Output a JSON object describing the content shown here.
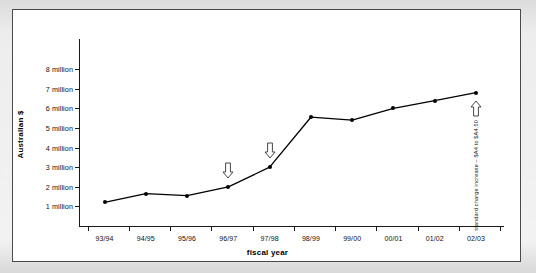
{
  "chart_data": {
    "type": "line",
    "title": "",
    "xlabel": "fiscal year",
    "ylabel": "Australian $",
    "categories": [
      "93/94",
      "94/95",
      "95/96",
      "96/97",
      "97/98",
      "98/99",
      "99/00",
      "00/01",
      "01/02",
      "02/03"
    ],
    "values": [
      1.2,
      1.65,
      1.55,
      2.0,
      3.0,
      5.55,
      5.4,
      6.0,
      6.4,
      6.8
    ],
    "series": [
      {
        "name": "Australian $",
        "values": [
          1.2,
          1.65,
          1.55,
          2.0,
          3.0,
          5.55,
          5.4,
          6.0,
          6.4,
          6.8
        ]
      }
    ],
    "ylim": [
      0,
      8
    ],
    "ytick_values": [
      1,
      2,
      3,
      4,
      5,
      6,
      7,
      8
    ],
    "ytick_labels": [
      "1 million",
      "2 million",
      "3 million",
      "4 million",
      "5 million",
      "6 million",
      "7 million",
      "8 million"
    ],
    "grid": false,
    "legend": false,
    "marker": "filled-circle",
    "line_color": "#000000",
    "annotations": [
      {
        "text": "standard charge increase – $A1 to $A2",
        "category": "96/97",
        "arrow": "down-arrow-icon",
        "arrow_direction": "down"
      },
      {
        "text": "standard charge increase – $A2 to $A4",
        "category": "97/98",
        "arrow": "down-arrow-icon",
        "arrow_direction": "down"
      },
      {
        "text": "standard charge increase – $A4 to $A4.50",
        "category": "02/03",
        "arrow": "up-arrow-icon",
        "arrow_direction": "up"
      }
    ]
  },
  "colors": {
    "page_background": "#e9e9e9",
    "chart_background": "#ffffff",
    "frame_border": "#4a4a4a",
    "axis": "#1a1a1a",
    "text": "#111111"
  }
}
